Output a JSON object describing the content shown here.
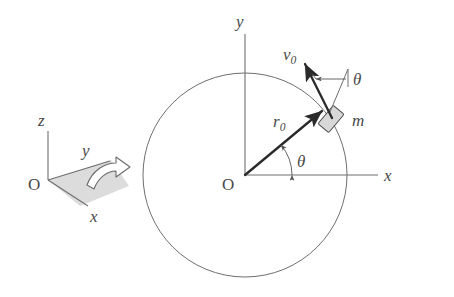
{
  "figure": {
    "background_color": "#ffffff",
    "line_color": "#6f6f6f",
    "bold_line_color": "#2a2a2a",
    "block_fill_color": "#d8d8d8",
    "plane_fill_color": "#dcdcdc"
  },
  "coordinate_triad": {
    "origin_label": "O",
    "axis_z_label": "z",
    "axis_y_label": "y",
    "axis_x_label": "x",
    "rotation_arrow_name": "rotation-arrow"
  },
  "main_diagram": {
    "origin_label": "O",
    "axis_y_label": "y",
    "axis_x_label": "x",
    "radius_label": "r",
    "radius_subscript": "0",
    "velocity_label": "v",
    "velocity_subscript": "0",
    "mass_label": "m",
    "angle_label_polar": "θ",
    "angle_label_velocity": "θ"
  },
  "geometry": {
    "circle_center_x": 245,
    "circle_center_y": 175,
    "circle_radius": 102,
    "block_angle_deg": 40,
    "velocity_angle_deg": 130
  }
}
